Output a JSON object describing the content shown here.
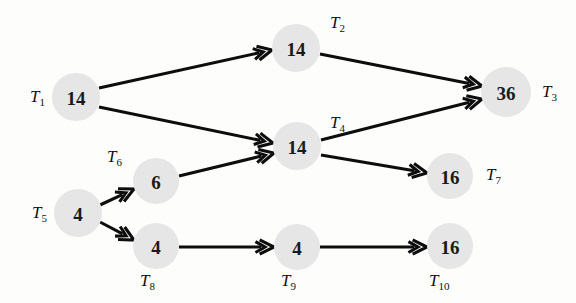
{
  "diagram": {
    "background_color": "#fdfdfc",
    "node_fill_color": "#e6e6e6",
    "edge_color": "#0d0d0d",
    "nodes": [
      {
        "id": "T1",
        "label": "T",
        "subscript": "1",
        "value": "14",
        "cx": 76,
        "cy": 97,
        "r": 24,
        "label_x": 30,
        "label_y": 88
      },
      {
        "id": "T2",
        "label": "T",
        "subscript": "2",
        "value": "14",
        "cx": 296,
        "cy": 48,
        "r": 24,
        "label_x": 330,
        "label_y": 14
      },
      {
        "id": "T3",
        "label": "T",
        "subscript": "3",
        "value": "36",
        "cx": 506,
        "cy": 92,
        "r": 25,
        "label_x": 542,
        "label_y": 83
      },
      {
        "id": "T4",
        "label": "T",
        "subscript": "4",
        "value": "14",
        "cx": 297,
        "cy": 146,
        "r": 24,
        "label_x": 330,
        "label_y": 114
      },
      {
        "id": "T5",
        "label": "T",
        "subscript": "5",
        "value": "4",
        "cx": 78,
        "cy": 213,
        "r": 24,
        "label_x": 32,
        "label_y": 204
      },
      {
        "id": "T6",
        "label": "T",
        "subscript": "6",
        "value": "6",
        "cx": 156,
        "cy": 181,
        "r": 23,
        "label_x": 107,
        "label_y": 148
      },
      {
        "id": "T7",
        "label": "T",
        "subscript": "7",
        "value": "16",
        "cx": 450,
        "cy": 176,
        "r": 23,
        "label_x": 486,
        "label_y": 166
      },
      {
        "id": "T8",
        "label": "T",
        "subscript": "8",
        "value": "4",
        "cx": 156,
        "cy": 246,
        "r": 23,
        "label_x": 140,
        "label_y": 272
      },
      {
        "id": "T9",
        "label": "T",
        "subscript": "9",
        "value": "4",
        "cx": 297,
        "cy": 247,
        "r": 23,
        "label_x": 281,
        "label_y": 272
      },
      {
        "id": "T10",
        "label": "T",
        "subscript": "10",
        "value": "16",
        "cx": 450,
        "cy": 246,
        "r": 23,
        "label_x": 429,
        "label_y": 272
      }
    ],
    "edges": [
      {
        "from": "T1",
        "to": "T2",
        "x1": 99,
        "y1": 88,
        "x2": 272,
        "y2": 50
      },
      {
        "from": "T1",
        "to": "T4",
        "x1": 99,
        "y1": 107,
        "x2": 273,
        "y2": 143
      },
      {
        "from": "T2",
        "to": "T3",
        "x1": 320,
        "y1": 54,
        "x2": 482,
        "y2": 86
      },
      {
        "from": "T4",
        "to": "T3",
        "x1": 321,
        "y1": 140,
        "x2": 482,
        "y2": 99
      },
      {
        "from": "T4",
        "to": "T7",
        "x1": 321,
        "y1": 155,
        "x2": 427,
        "y2": 173
      },
      {
        "from": "T5",
        "to": "T6",
        "x1": 100,
        "y1": 205,
        "x2": 134,
        "y2": 189
      },
      {
        "from": "T5",
        "to": "T8",
        "x1": 100,
        "y1": 222,
        "x2": 134,
        "y2": 240
      },
      {
        "from": "T6",
        "to": "T4",
        "x1": 179,
        "y1": 176,
        "x2": 274,
        "y2": 153
      },
      {
        "from": "T8",
        "to": "T9",
        "x1": 179,
        "y1": 247,
        "x2": 274,
        "y2": 247
      },
      {
        "from": "T9",
        "to": "T10",
        "x1": 320,
        "y1": 247,
        "x2": 427,
        "y2": 247
      }
    ]
  }
}
